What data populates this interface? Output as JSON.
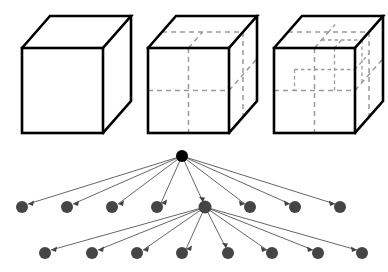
{
  "figure": {
    "background_color": "#ffffff",
    "width": 388,
    "height": 272,
    "panels": [
      {
        "id": "cube-row",
        "label": "Cube subdivision row",
        "description": "Three wireframe cubes shown in isometric-style projection with increasing levels of internal subdivision",
        "items": [
          {
            "id": "cube-level-0",
            "label": "Undivided cube",
            "subdivision": "1x1x1",
            "cell_count": 1,
            "has_dashed_interior": false
          },
          {
            "id": "cube-level-1",
            "label": "Once-subdivided cube",
            "subdivision": "2x2x2",
            "cell_count": 8,
            "has_dashed_interior": true
          },
          {
            "id": "cube-level-2",
            "label": "Twice-subdivided cube",
            "subdivision": "2x2x2 with one octant further split into 2x2x2",
            "cell_count": 15,
            "has_dashed_interior": true
          }
        ]
      },
      {
        "id": "tree-diagram",
        "label": "Octree node graph",
        "description": "Root node branching to eight children; the fifth child branches to eight further children",
        "levels": [
          {
            "id": "level-0",
            "label": "Root level",
            "node_count": 1,
            "node_color": "#000000",
            "node_radius": 6.0,
            "y": 156
          },
          {
            "id": "level-1",
            "label": "First subdivision level",
            "node_count": 8,
            "node_color": "#454545",
            "node_radius": 6.0,
            "y": 207
          },
          {
            "id": "level-2",
            "label": "Second subdivision level",
            "node_count": 8,
            "node_color": "#454545",
            "node_radius": 6.0,
            "y": 253
          }
        ],
        "branching_child_index": 4,
        "edge_color": "#555555"
      }
    ],
    "colors": {
      "cube_edge": "#000000",
      "cube_interior_dashed": "#9a9a9a",
      "cube_face_fill": "#ffffff",
      "root_node": "#000000",
      "child_node": "#454545",
      "edge": "#555555"
    }
  },
  "geometry": {
    "cubes": [
      {
        "id": "cube-level-0",
        "front_left": 22,
        "front_right": 103,
        "front_top": 48,
        "front_bottom": 133,
        "depth_dx": 28,
        "depth_dy": -32
      },
      {
        "id": "cube-level-1",
        "front_left": 148,
        "front_right": 229,
        "front_top": 48,
        "front_bottom": 133,
        "depth_dx": 28,
        "depth_dy": -32
      },
      {
        "id": "cube-level-2",
        "front_left": 274,
        "front_right": 355,
        "front_top": 48,
        "front_bottom": 133,
        "depth_dx": 28,
        "depth_dy": -32
      }
    ],
    "tree": {
      "root": {
        "x": 182,
        "y": 156
      },
      "level1_x": [
        22,
        67,
        112,
        157,
        205,
        250,
        295,
        340
      ],
      "level1_y": 207,
      "level2_x": [
        45,
        92,
        137,
        182,
        228,
        272,
        318,
        362
      ],
      "level2_y": 253,
      "branch_parent": {
        "x": 205,
        "y": 207
      }
    }
  }
}
